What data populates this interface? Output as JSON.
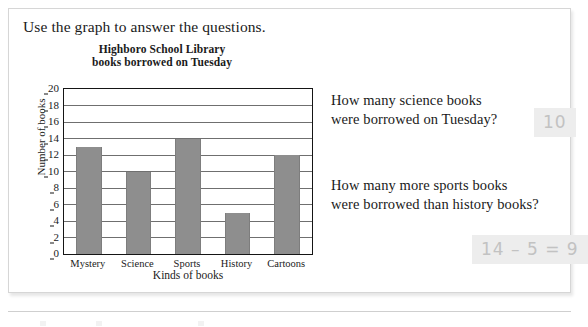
{
  "worksheet": {
    "instruction": "Use the graph to answer the questions.",
    "questions": [
      {
        "line1": "How many science books",
        "line2": "were borrowed on Tuesday?",
        "answer": "10"
      },
      {
        "line1": "How many more sports books",
        "line2": "were borrowed than history books?",
        "answer": "14 – 5 = 9"
      }
    ]
  },
  "chart_data": {
    "type": "bar",
    "title": "Highboro School Library books borrowed on Tuesday",
    "title_line1": "Highboro School Library",
    "title_line2": "books borrowed on Tuesday",
    "xlabel": "Kinds of books",
    "ylabel": "Number of books",
    "categories": [
      "Mystery",
      "Science",
      "Sports",
      "History",
      "Cartoons"
    ],
    "values": [
      13,
      10,
      14,
      5,
      12
    ],
    "ylim": [
      0,
      20
    ],
    "ytick_step": 2,
    "yticks": [
      "0",
      "2",
      "4",
      "6",
      "8",
      "10",
      "12",
      "14",
      "16",
      "18",
      "20"
    ],
    "grid": true,
    "legend": "none",
    "bar_color": "#8e8e8e",
    "axis_color": "#151515"
  },
  "colors": {
    "panel_border": "#d6d6d6",
    "answer_background": "#ededed",
    "answer_text": "#c2c2c2",
    "text": "#1a1a1a"
  }
}
